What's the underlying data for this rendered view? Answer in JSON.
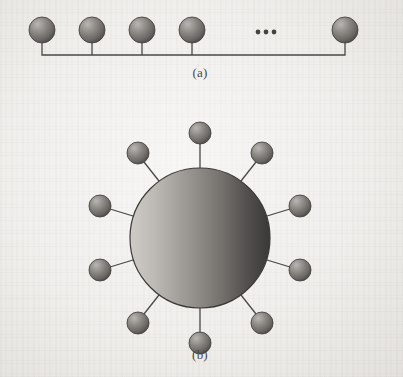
{
  "figure": {
    "background_color": "#efedea",
    "line_color": "#4a4846",
    "panels": [
      {
        "id": "a",
        "caption": "(a)",
        "topology": "bus",
        "node_count_drawn": 5,
        "continuation_marker": "ellipsis",
        "nodes": [
          {
            "name": "bus-node-1",
            "cx": 42,
            "cy": 30,
            "r": 13
          },
          {
            "name": "bus-node-2",
            "cx": 92,
            "cy": 30,
            "r": 13
          },
          {
            "name": "bus-node-3",
            "cx": 142,
            "cy": 30,
            "r": 13
          },
          {
            "name": "bus-node-4",
            "cx": 192,
            "cy": 30,
            "r": 13
          },
          {
            "name": "bus-node-5",
            "cx": 345,
            "cy": 30,
            "r": 13
          }
        ],
        "bus_line": {
          "y": 55,
          "x_start": 42,
          "x_end": 345
        },
        "ellipsis_dots": [
          {
            "cx": 258,
            "cy": 32,
            "r": 2.4
          },
          {
            "cx": 266,
            "cy": 32,
            "r": 2.4
          },
          {
            "cx": 274,
            "cy": 32,
            "r": 2.4
          }
        ]
      },
      {
        "id": "b",
        "caption": "(b)",
        "topology": "star",
        "hub": {
          "name": "hub-node",
          "cx": 200,
          "cy": 238,
          "r": 70
        },
        "satellite_count": 10,
        "satellites": [
          {
            "name": "satellite-node-1",
            "angle_deg": -90,
            "cx": 200,
            "cy": 133,
            "r": 11
          },
          {
            "name": "satellite-node-2",
            "angle_deg": -54,
            "cx": 262,
            "cy": 153,
            "r": 11
          },
          {
            "name": "satellite-node-3",
            "angle_deg": -18,
            "cx": 300,
            "cy": 206,
            "r": 11
          },
          {
            "name": "satellite-node-4",
            "angle_deg": 18,
            "cx": 300,
            "cy": 270,
            "r": 11
          },
          {
            "name": "satellite-node-5",
            "angle_deg": 54,
            "cx": 262,
            "cy": 323,
            "r": 11
          },
          {
            "name": "satellite-node-6",
            "angle_deg": 90,
            "cx": 200,
            "cy": 343,
            "r": 11
          },
          {
            "name": "satellite-node-7",
            "angle_deg": 126,
            "cx": 138,
            "cy": 323,
            "r": 11
          },
          {
            "name": "satellite-node-8",
            "angle_deg": 162,
            "cx": 100,
            "cy": 270,
            "r": 11
          },
          {
            "name": "satellite-node-9",
            "angle_deg": 198,
            "cx": 100,
            "cy": 206,
            "r": 11
          },
          {
            "name": "satellite-node-10",
            "angle_deg": 234,
            "cx": 138,
            "cy": 153,
            "r": 11
          }
        ]
      }
    ],
    "node_gradient": {
      "highlight": "#b4b2af",
      "midtone": "#86837f",
      "shadow": "#4e4b48"
    },
    "hub_gradient": {
      "light_left": "#c9c6c2",
      "mid": "#8d8a86",
      "dark_right": "#3a3836"
    }
  }
}
